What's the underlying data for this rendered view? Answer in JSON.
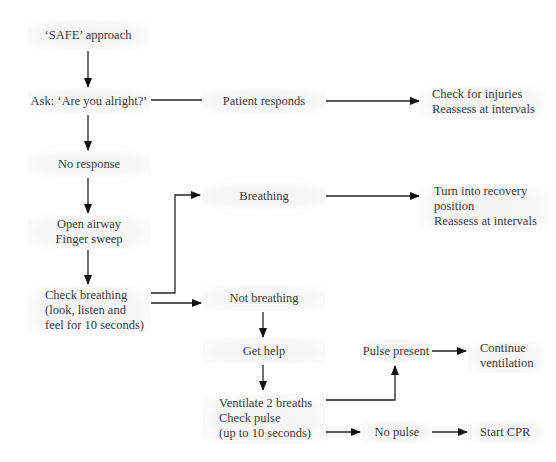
{
  "diagram": {
    "type": "flowchart",
    "nodes": [
      {
        "id": "safe",
        "lines": [
          "‘SAFE’ approach"
        ]
      },
      {
        "id": "ask",
        "lines": [
          "Ask: ‘Are you alright?’"
        ]
      },
      {
        "id": "responds",
        "lines": [
          "Patient responds"
        ]
      },
      {
        "id": "injuries",
        "lines": [
          "Check for injuries",
          "Reassess at intervals"
        ]
      },
      {
        "id": "noresponse",
        "lines": [
          "No response"
        ]
      },
      {
        "id": "airway",
        "lines": [
          "Open airway",
          "Finger sweep"
        ]
      },
      {
        "id": "checkbreathing",
        "lines": [
          "Check breathing",
          "(look, listen and",
          "feel for 10 seconds)"
        ]
      },
      {
        "id": "breathing",
        "lines": [
          "Breathing"
        ]
      },
      {
        "id": "recovery",
        "lines": [
          "Turn into recovery",
          "position",
          "Reassess at intervals"
        ]
      },
      {
        "id": "notbreathing",
        "lines": [
          "Not breathing"
        ]
      },
      {
        "id": "gethelp",
        "lines": [
          "Get help"
        ]
      },
      {
        "id": "ventilate",
        "lines": [
          "Ventilate 2 breaths",
          "Check pulse",
          "(up to 10 seconds)"
        ]
      },
      {
        "id": "pulsepresent",
        "lines": [
          "Pulse present"
        ]
      },
      {
        "id": "continue",
        "lines": [
          "Continue",
          "ventilation"
        ]
      },
      {
        "id": "nopulse",
        "lines": [
          "No pulse"
        ]
      },
      {
        "id": "cpr",
        "lines": [
          "Start CPR"
        ]
      }
    ],
    "edges": [
      {
        "from": "safe",
        "to": "ask",
        "arrow": true
      },
      {
        "from": "ask",
        "to": "responds",
        "arrow": false
      },
      {
        "from": "responds",
        "to": "injuries",
        "arrow": true
      },
      {
        "from": "ask",
        "to": "noresponse",
        "arrow": true
      },
      {
        "from": "noresponse",
        "to": "airway",
        "arrow": true
      },
      {
        "from": "airway",
        "to": "checkbreathing",
        "arrow": true
      },
      {
        "from": "checkbreathing",
        "to": "breathing",
        "arrow": true
      },
      {
        "from": "breathing",
        "to": "recovery",
        "arrow": true
      },
      {
        "from": "checkbreathing",
        "to": "notbreathing",
        "arrow": true
      },
      {
        "from": "notbreathing",
        "to": "gethelp",
        "arrow": true
      },
      {
        "from": "gethelp",
        "to": "ventilate",
        "arrow": true
      },
      {
        "from": "ventilate",
        "to": "pulsepresent",
        "arrow": true
      },
      {
        "from": "pulsepresent",
        "to": "continue",
        "arrow": true
      },
      {
        "from": "ventilate",
        "to": "nopulse",
        "arrow": true
      },
      {
        "from": "nopulse",
        "to": "cpr",
        "arrow": true
      }
    ]
  },
  "colors": {
    "line": "#111111",
    "text": "#3a3a3a",
    "box": "#f5f5f5"
  }
}
